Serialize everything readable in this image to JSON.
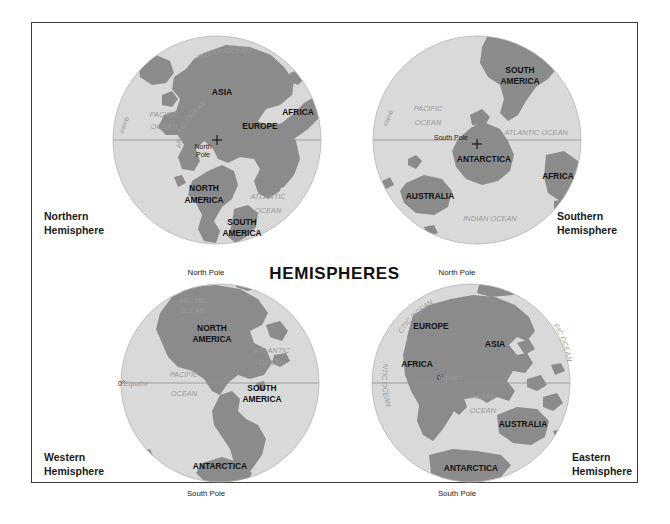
{
  "poster": {
    "title": "HEMISPHERES",
    "background_color": "#ffffff",
    "frame_color": "#3a3a3a",
    "land_color": "#8b8b8b",
    "ocean_color": "#d9d9d9",
    "label_color": "#121212",
    "ocean_label_color": "#9a9a9a"
  },
  "globes": {
    "northern": {
      "caption_line1": "Northern",
      "caption_line2": "Hemisphere",
      "pole_marker": "North Pole",
      "equator_label": "0°-Equator",
      "continents": [
        "ASIA",
        "EUROPE",
        "AFRICA",
        "NORTH AMERICA",
        "SOUTH AMERICA"
      ],
      "continent_labels": [
        {
          "line1": "ASIA",
          "line2": ""
        },
        {
          "line1": "EUROPE",
          "line2": ""
        },
        {
          "line1": "AFRICA",
          "line2": ""
        },
        {
          "line1": "NORTH",
          "line2": "AMERICA"
        },
        {
          "line1": "SOUTH",
          "line2": "AMERICA"
        }
      ],
      "oceans": [
        {
          "line1": "INDIAN OCEAN",
          "line2": ""
        },
        {
          "line1": "PACIFIC",
          "line2": "OCEAN"
        },
        {
          "line1": "ATLANTIC",
          "line2": "OCEAN"
        },
        {
          "line1": "ARCTIC OCEAN",
          "line2": ""
        }
      ]
    },
    "southern": {
      "caption_line1": "Southern",
      "caption_line2": "Hemisphere",
      "pole_marker": "South Pole",
      "equator_label": "0°-Equator",
      "continents": [
        "SOUTH AMERICA",
        "ANTARCTICA",
        "AFRICA",
        "AUSTRALIA"
      ],
      "continent_labels": [
        {
          "line1": "SOUTH",
          "line2": "AMERICA"
        },
        {
          "line1": "ANTARCTICA",
          "line2": ""
        },
        {
          "line1": "AFRICA",
          "line2": ""
        },
        {
          "line1": "AUSTRALIA",
          "line2": ""
        }
      ],
      "oceans": [
        {
          "line1": "PACIFIC",
          "line2": "OCEAN"
        },
        {
          "line1": "ATLANTIC OCEAN",
          "line2": ""
        },
        {
          "line1": "INDIAN OCEAN",
          "line2": ""
        }
      ]
    },
    "western": {
      "caption_line1": "Western",
      "caption_line2": "Hemisphere",
      "pole_top": "North Pole",
      "pole_bottom": "South Pole",
      "equator_degree": "0°",
      "equator_label": "Equator",
      "continents": [
        "NORTH AMERICA",
        "SOUTH AMERICA",
        "ANTARCTICA"
      ],
      "continent_labels": [
        {
          "line1": "NORTH",
          "line2": "AMERICA"
        },
        {
          "line1": "SOUTH",
          "line2": "AMERICA"
        },
        {
          "line1": "ANTARCTICA",
          "line2": ""
        }
      ],
      "oceans": [
        {
          "line1": "ARCTIC",
          "line2": "OCEAN"
        },
        {
          "line1": "ATLANTIC",
          "line2": "OCEAN"
        },
        {
          "line1": "PACIFIC",
          "line2": "OCEAN"
        }
      ]
    },
    "eastern": {
      "caption_line1": "Eastern",
      "caption_line2": "Hemisphere",
      "pole_top": "North Pole",
      "pole_bottom": "South Pole",
      "equator_degree": "0°",
      "equator_label": "Equator",
      "continents": [
        "EUROPE",
        "ASIA",
        "AFRICA",
        "AUSTRALIA",
        "ANTARCTICA"
      ],
      "continent_labels": [
        {
          "line1": "EUROPE",
          "line2": ""
        },
        {
          "line1": "ASIA",
          "line2": ""
        },
        {
          "line1": "AFRICA",
          "line2": ""
        },
        {
          "line1": "AUSTRALIA",
          "line2": ""
        },
        {
          "line1": "ANTARCTICA",
          "line2": ""
        }
      ],
      "oceans": [
        {
          "line1": "ARCTIC OCEAN",
          "line2": ""
        },
        {
          "line1": "PACIFIC OCEAN",
          "line2": ""
        },
        {
          "line1": "ATLANTIC OCEAN",
          "line2": ""
        },
        {
          "line1": "INDIAN",
          "line2": "OCEAN"
        }
      ]
    }
  }
}
